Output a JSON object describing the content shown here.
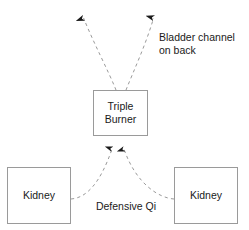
{
  "diagram": {
    "type": "flow-diagram",
    "colors": {
      "background": "#ffffff",
      "box_border": "#9a9a9a",
      "dashed_line": "#9a9a9a",
      "arrow_head": "#1a1a1a",
      "text": "#1a1a1a"
    },
    "nodes": [
      {
        "id": "triple-burner",
        "label": "Triple\nBurner",
        "shape": "rectangle",
        "x": 93,
        "y": 90,
        "width": 55,
        "height": 46
      },
      {
        "id": "kidney-left",
        "label": "Kidney",
        "shape": "rectangle",
        "x": 7,
        "y": 167,
        "width": 64,
        "height": 57
      },
      {
        "id": "kidney-right",
        "label": "Kidney",
        "shape": "rectangle",
        "x": 174,
        "y": 167,
        "width": 64,
        "height": 57
      }
    ],
    "labels": [
      {
        "id": "bladder-channel",
        "text": "Bladder channel\non back",
        "x": 159,
        "y": 31
      },
      {
        "id": "defensive-qi",
        "text": "Defensive Qi",
        "x": 86,
        "y": 200
      }
    ],
    "connectors": [
      {
        "id": "triple-burner-to-upper-left",
        "from": "triple-burner",
        "to": "bladder-channel-upper-left",
        "style": "dashed",
        "arrow": "up",
        "arrow_x": 82,
        "arrow_y": 7
      },
      {
        "id": "triple-burner-to-upper-right",
        "from": "triple-burner",
        "to": "bladder-channel-upper-right",
        "style": "dashed",
        "arrow": "up",
        "arrow_x": 155,
        "arrow_y": 7
      },
      {
        "id": "kidney-left-to-triple-burner",
        "from": "kidney-left",
        "to": "triple-burner",
        "style": "dashed",
        "arrow": "up",
        "arrow_x": 113,
        "arrow_y": 139
      },
      {
        "id": "kidney-right-to-triple-burner",
        "from": "kidney-right",
        "to": "triple-burner",
        "style": "dashed",
        "arrow": "up",
        "arrow_x": 123,
        "arrow_y": 139
      }
    ]
  }
}
